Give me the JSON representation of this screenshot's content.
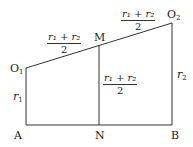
{
  "diagram": {
    "points": {
      "O1": {
        "label": "O",
        "sub": "1"
      },
      "O2": {
        "label": "O",
        "sub": "2"
      },
      "M": {
        "label": "M"
      },
      "A": {
        "label": "A"
      },
      "N": {
        "label": "N"
      },
      "B": {
        "label": "B"
      }
    },
    "side_labels": {
      "r1": {
        "var": "r",
        "sub": "1"
      },
      "r2": {
        "var": "r",
        "sub": "2"
      }
    },
    "fractions": {
      "O1M": {
        "numerator": "r₁ + r₂",
        "denominator": "2"
      },
      "MO2": {
        "numerator": "r₁ + r₂",
        "denominator": "2"
      },
      "MN": {
        "numerator": "r₁ + r₂",
        "denominator": "2"
      }
    },
    "line_color": "#333333"
  }
}
